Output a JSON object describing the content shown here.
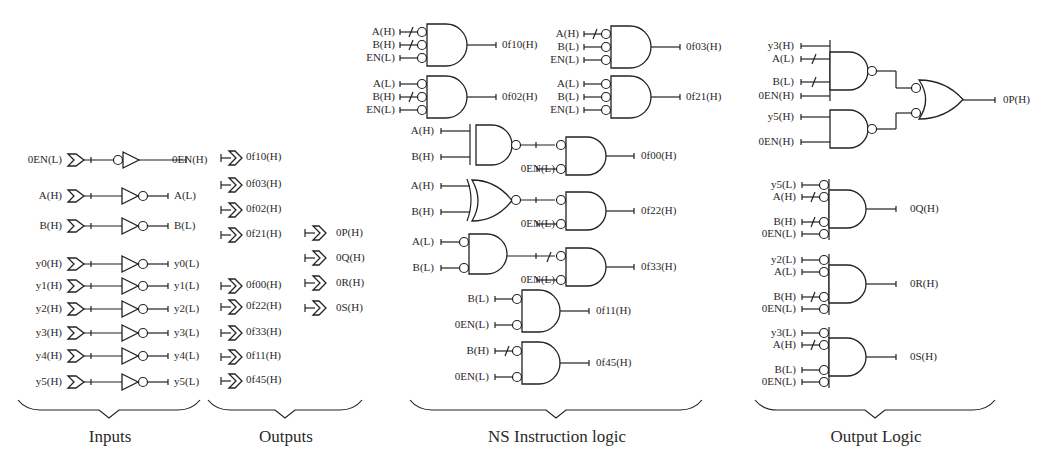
{
  "sections": [
    {
      "id": "inputs",
      "label": "Inputs",
      "brace": [
        18,
        200,
        400
      ],
      "label_x": 110
    },
    {
      "id": "outputs",
      "label": "Outputs",
      "brace": [
        208,
        362,
        400
      ],
      "label_x": 286
    },
    {
      "id": "ns",
      "label": "NS Instruction logic",
      "brace": [
        410,
        702,
        400
      ],
      "label_x": 557
    },
    {
      "id": "outlogic",
      "label": "Output Logic",
      "brace": [
        755,
        995,
        400
      ],
      "label_x": 876
    }
  ],
  "inputs": [
    {
      "in": "0EN(L)",
      "out": "0EN(H)",
      "y": 160,
      "bubble_before": true
    },
    {
      "in": "A(H)",
      "out": "A(L)",
      "y": 196
    },
    {
      "in": "B(H)",
      "out": "B(L)",
      "y": 226
    },
    {
      "in": "y0(H)",
      "out": "y0(L)",
      "y": 264
    },
    {
      "in": "y1(H)",
      "out": "y1(L)",
      "y": 286
    },
    {
      "in": "y2(H)",
      "out": "y2(L)",
      "y": 309
    },
    {
      "in": "y3(H)",
      "out": "y3(L)",
      "y": 333
    },
    {
      "in": "y4(H)",
      "out": "y4(L)",
      "y": 356
    },
    {
      "in": "y5(H)",
      "out": "y5(L)",
      "y": 382
    }
  ],
  "outputs_col1": [
    {
      "label": "0f10(H)",
      "y": 158
    },
    {
      "label": "0f03(H)",
      "y": 185
    },
    {
      "label": "0f02(H)",
      "y": 210
    },
    {
      "label": "0f21(H)",
      "y": 235
    },
    {
      "label": "0f00(H)",
      "y": 286
    },
    {
      "label": "0f22(H)",
      "y": 307
    },
    {
      "label": "0f33(H)",
      "y": 333
    },
    {
      "label": "0f11(H)",
      "y": 357
    },
    {
      "label": "0f45(H)",
      "y": 381
    }
  ],
  "outputs_col2": [
    {
      "label": "0P(H)",
      "y": 233
    },
    {
      "label": "0Q(H)",
      "y": 258
    },
    {
      "label": "0R(H)",
      "y": 283
    },
    {
      "label": "0S(H)",
      "y": 308
    }
  ],
  "ns_and3": [
    {
      "x": 400,
      "y": 20,
      "inputs": [
        {
          "label": "A(H)",
          "slash": true
        },
        {
          "label": "B(H)",
          "slash": true
        },
        {
          "label": "EN(L)",
          "slash": false
        }
      ],
      "output": "0f10(H)"
    },
    {
      "x": 584,
      "y": 22,
      "inputs": [
        {
          "label": "A(H)",
          "slash": true
        },
        {
          "label": "B(L)",
          "slash": false
        },
        {
          "label": "EN(L)",
          "slash": false
        }
      ],
      "output": "0f03(H)"
    },
    {
      "x": 400,
      "y": 72,
      "inputs": [
        {
          "label": "A(L)",
          "slash": false
        },
        {
          "label": "B(H)",
          "slash": true
        },
        {
          "label": "EN(L)",
          "slash": false
        }
      ],
      "output": "0f02(H)"
    },
    {
      "x": 584,
      "y": 72,
      "inputs": [
        {
          "label": "A(L)",
          "slash": false
        },
        {
          "label": "B(L)",
          "slash": false
        },
        {
          "label": "EN(L)",
          "slash": false
        }
      ],
      "output": "0f21(H)"
    }
  ],
  "ns_two_stage": [
    {
      "first": "nand",
      "a": "A(H)",
      "b": "B(H)",
      "en": "0EN(L)",
      "output": "0f00(H)",
      "y": 125,
      "slash": false
    },
    {
      "first": "xnor",
      "a": "A(H)",
      "b": "B(H)",
      "en": "0EN(L)",
      "output": "0f22(H)",
      "y": 180,
      "slash": false
    },
    {
      "first": "and_bub",
      "a": "A(L)",
      "b": "B(L)",
      "en": "0EN(L)",
      "output": "0f33(H)",
      "y": 236,
      "slash": true
    }
  ],
  "ns_and2": [
    {
      "a": "B(L)",
      "a_slash": false,
      "en": "0EN(L)",
      "output": "0f11(H)",
      "y": 297
    },
    {
      "a": "B(H)",
      "a_slash": true,
      "en": "0EN(L)",
      "output": "0f45(H)",
      "y": 349
    }
  ],
  "output_logic": {
    "p": {
      "nand1": [
        "y3(H)",
        "A(L)",
        "B(L)",
        "0EN(H)"
      ],
      "nand1_slash": [
        false,
        true,
        true,
        false
      ],
      "nand2": [
        "y5(H)",
        "0EN(H)"
      ],
      "output": "0P(H)"
    },
    "and4": [
      {
        "inputs": [
          "y5(L)",
          "A(H)",
          "B(H)",
          "0EN(L)"
        ],
        "slash": [
          false,
          true,
          true,
          false
        ],
        "output": "0Q(H)",
        "y": 182
      },
      {
        "inputs": [
          "y2(L)",
          "A(L)",
          "B(H)",
          "0EN(L)"
        ],
        "slash": [
          false,
          false,
          true,
          false
        ],
        "output": "0R(H)",
        "y": 257
      },
      {
        "inputs": [
          "y3(L)",
          "A(H)",
          "B(L)",
          "0EN(L)"
        ],
        "slash": [
          false,
          true,
          false,
          false
        ],
        "output": "0S(H)",
        "y": 330
      }
    ]
  },
  "colors": {
    "ink": "#222222",
    "text": "#2a2a2a",
    "background": "#ffffff"
  }
}
